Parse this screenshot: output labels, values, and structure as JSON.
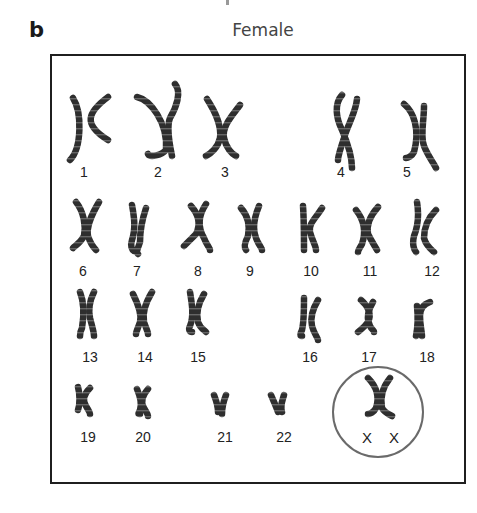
{
  "figure": {
    "panel_letter": "b",
    "title": "Female",
    "colors": {
      "chromosome": "#2e2e2e",
      "chromosome_band": "#8a8a8a",
      "frame": "#1f1f1f",
      "circle": "#6a6a6a",
      "text": "#222222"
    }
  },
  "karyotype": {
    "rows": [
      {
        "row": 1,
        "chromosomes": [
          {
            "label": "1"
          },
          {
            "label": "2"
          },
          {
            "label": "3"
          },
          {
            "label": "4"
          },
          {
            "label": "5"
          }
        ]
      },
      {
        "row": 2,
        "chromosomes": [
          {
            "label": "6"
          },
          {
            "label": "7"
          },
          {
            "label": "8"
          },
          {
            "label": "9"
          },
          {
            "label": "10"
          },
          {
            "label": "11"
          },
          {
            "label": "12"
          }
        ]
      },
      {
        "row": 3,
        "chromosomes": [
          {
            "label": "13"
          },
          {
            "label": "14"
          },
          {
            "label": "15"
          },
          {
            "label": "16"
          },
          {
            "label": "17"
          },
          {
            "label": "18"
          }
        ]
      },
      {
        "row": 4,
        "chromosomes": [
          {
            "label": "19"
          },
          {
            "label": "20"
          },
          {
            "label": "21"
          },
          {
            "label": "22"
          }
        ]
      }
    ],
    "sex_chromosomes": {
      "highlighted": true,
      "labels": [
        "X",
        "X"
      ]
    }
  }
}
